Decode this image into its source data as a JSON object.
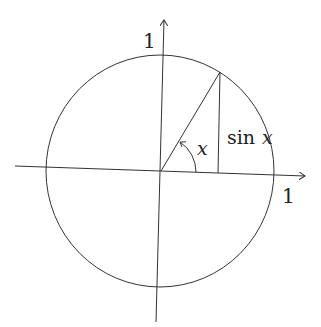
{
  "diagram": {
    "labels": {
      "y_axis_one": "1",
      "x_axis_one": "1",
      "angle": "x",
      "sine_fn": "sin",
      "sine_var": "x"
    },
    "stroke_color": "#333333",
    "background": "#ffffff"
  }
}
